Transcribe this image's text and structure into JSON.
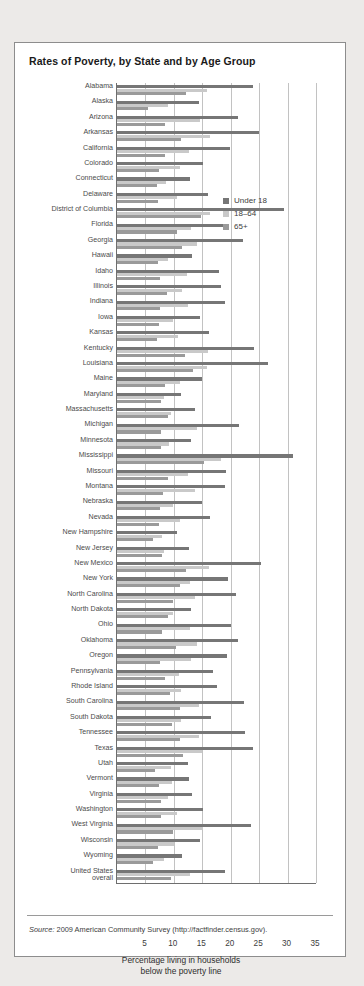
{
  "figure": {
    "title": "Rates of Poverty, by State and by Age Group",
    "source_prefix": "Source:",
    "source_text": " 2009 American Community Survey (http://factfinder.census.gov)."
  },
  "legend": {
    "position": "inside-top-right",
    "items": [
      {
        "label": "Under 18",
        "color": "#767676"
      },
      {
        "label": "18–64",
        "color": "#c9c9c9"
      },
      {
        "label": "65+",
        "color": "#9a9a9a"
      }
    ]
  },
  "axis": {
    "xlabel_line1": "Percentage living in households",
    "xlabel_line2": "below the poverty line",
    "ticks": [
      "5",
      "10",
      "15",
      "20",
      "25",
      "30",
      "35"
    ]
  },
  "chart_data": {
    "type": "bar",
    "orientation": "horizontal",
    "title": "Rates of Poverty, by State and by Age Group",
    "xlabel": "Percentage living in households below the poverty line",
    "ylabel": "",
    "xlim": [
      0,
      35
    ],
    "grid": true,
    "legend_position": "inside-top-right",
    "categories": [
      "Alabama",
      "Alaska",
      "Arizona",
      "Arkansas",
      "California",
      "Colorado",
      "Connecticut",
      "Delaware",
      "District of Columbia",
      "Florida",
      "Georgia",
      "Hawaii",
      "Idaho",
      "Illinois",
      "Indiana",
      "Iowa",
      "Kansas",
      "Kentucky",
      "Louisiana",
      "Maine",
      "Maryland",
      "Massachusetts",
      "Michigan",
      "Minnesota",
      "Mississippi",
      "Missouri",
      "Montana",
      "Nebraska",
      "Nevada",
      "New Hampshire",
      "New Jersey",
      "New Mexico",
      "New York",
      "North Carolina",
      "North Dakota",
      "Ohio",
      "Oklahoma",
      "Oregon",
      "Pennsylvania",
      "Rhode Island",
      "South Carolina",
      "South Dakota",
      "Tennessee",
      "Texas",
      "Utah",
      "Vermont",
      "Virginia",
      "Washington",
      "West Virginia",
      "Wisconsin",
      "Wyoming",
      "United States overall"
    ],
    "series": [
      {
        "name": "Under 18",
        "color": "#767676",
        "values": [
          24.0,
          14.5,
          21.2,
          25.0,
          19.9,
          15.1,
          12.9,
          16.0,
          29.4,
          19.3,
          22.2,
          13.2,
          18.0,
          18.3,
          19.0,
          14.6,
          16.1,
          24.1,
          26.5,
          15.0,
          11.2,
          13.7,
          21.5,
          13.1,
          30.9,
          19.1,
          19.0,
          15.0,
          16.4,
          10.6,
          12.6,
          25.3,
          19.5,
          21.0,
          13.1,
          20.1,
          21.3,
          19.3,
          16.9,
          17.5,
          22.3,
          16.5,
          22.5,
          24.0,
          12.4,
          12.6,
          13.2,
          15.2,
          23.6,
          14.6,
          11.5,
          19.0
        ]
      },
      {
        "name": "18–64",
        "color": "#c9c9c9",
        "values": [
          15.8,
          8.9,
          14.6,
          16.3,
          12.7,
          11.1,
          8.6,
          10.5,
          16.4,
          13.1,
          14.1,
          8.9,
          12.3,
          11.5,
          12.5,
          9.8,
          10.8,
          16.0,
          15.8,
          11.0,
          8.2,
          9.5,
          14.0,
          9.1,
          18.3,
          12.5,
          13.7,
          9.9,
          11.1,
          7.9,
          8.2,
          16.1,
          12.8,
          13.7,
          9.8,
          12.9,
          14.0,
          13.0,
          10.9,
          11.3,
          14.4,
          11.2,
          14.5,
          14.9,
          9.5,
          9.7,
          9.0,
          10.5,
          15.1,
          10.0,
          8.3,
          12.9
        ]
      },
      {
        "name": "65+",
        "color": "#9a9a9a",
        "values": [
          12.1,
          5.5,
          8.5,
          11.3,
          8.5,
          7.4,
          7.1,
          7.2,
          14.7,
          10.5,
          11.4,
          7.2,
          7.5,
          8.8,
          7.6,
          7.4,
          7.0,
          11.9,
          13.3,
          8.5,
          7.7,
          9.0,
          7.8,
          7.7,
          15.3,
          8.9,
          8.1,
          7.6,
          7.4,
          6.4,
          8.0,
          12.1,
          11.1,
          9.8,
          9.0,
          7.9,
          10.4,
          7.6,
          8.4,
          9.4,
          11.1,
          9.6,
          11.0,
          11.6,
          6.6,
          7.3,
          7.8,
          7.7,
          9.9,
          7.2,
          6.3,
          9.5
        ]
      }
    ]
  }
}
